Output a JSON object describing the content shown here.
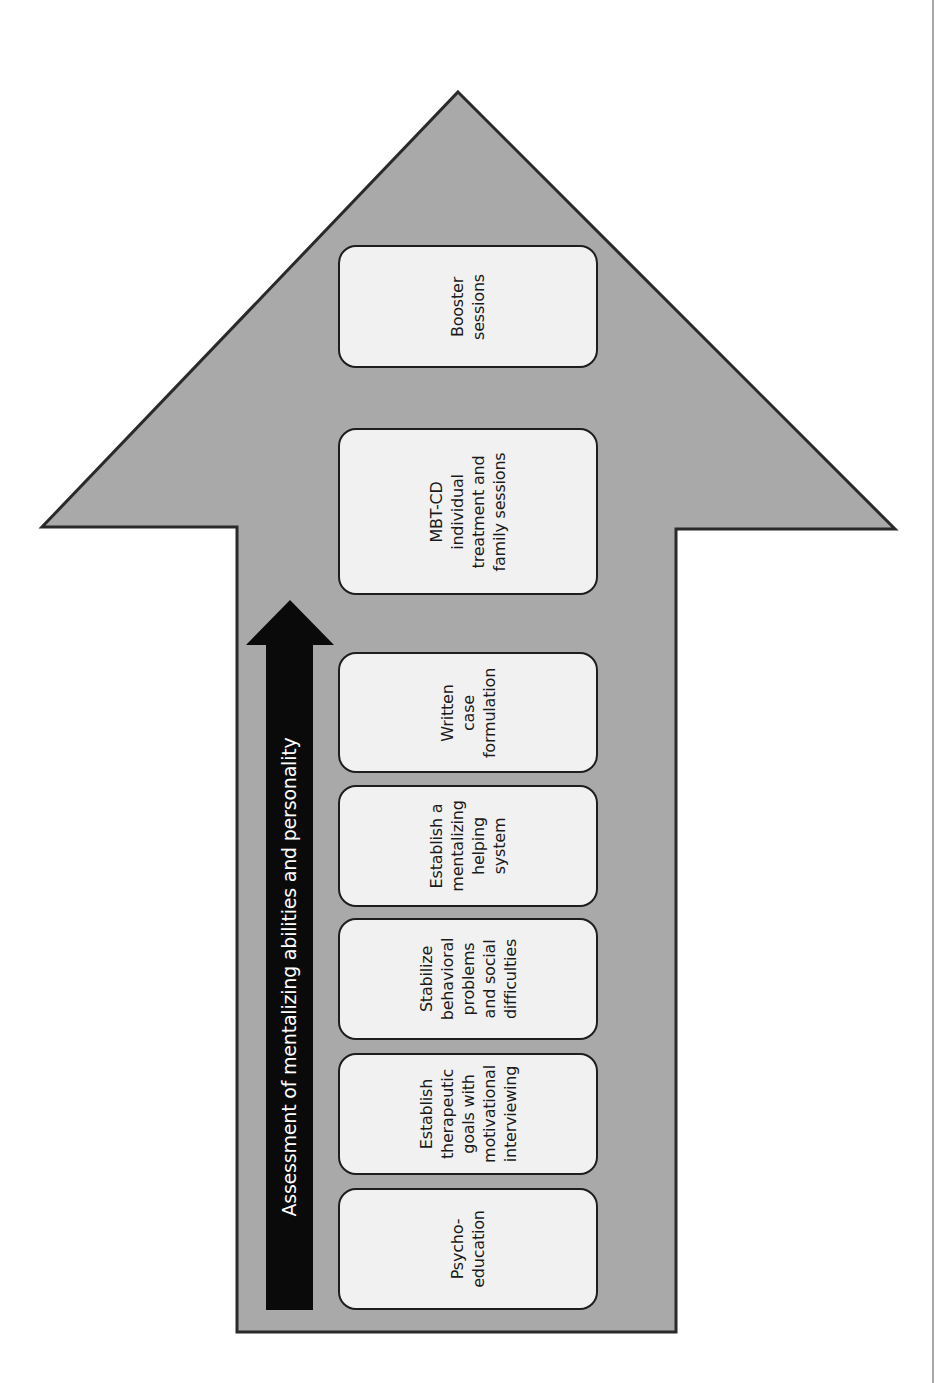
{
  "diagram": {
    "type": "process-arrow",
    "orientation": "upward",
    "colors": {
      "big_arrow_fill": "#a9a9a9",
      "big_arrow_stroke": "#2a2a2a",
      "box_fill": "#f1f1f1",
      "box_stroke": "#1e1e1e",
      "side_bar_fill": "#0a0a0a",
      "side_bar_text": "#ffffff"
    },
    "side_bar": {
      "label": "Assessment of mentalizing abilities and personality"
    },
    "steps": [
      {
        "label": "Psycho-\neducation"
      },
      {
        "label": "Establish\ntherapeutic\ngoals with\nmotivational\ninterviewing"
      },
      {
        "label": "Stabilize\nbehavioral\nproblems\nand social\ndifficulties"
      },
      {
        "label": "Establish a\nmentalizing\nhelping\nsystem"
      },
      {
        "label": "Written\ncase\nformulation"
      },
      {
        "label": "MBT-CD\nindividual\ntreatment and\nfamily sessions"
      },
      {
        "label": "Booster\nsessions"
      }
    ]
  }
}
